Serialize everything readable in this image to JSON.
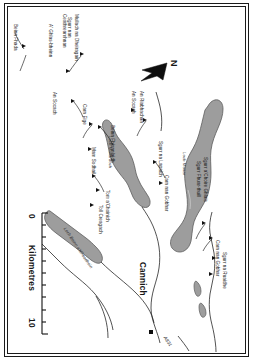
{
  "map": {
    "title": "Glen Affric and Cannich area relief map",
    "orientation_note": "map content rotated 90 degrees clockwise on page",
    "north_arrow": {
      "label": "N",
      "name": "north-arrow"
    },
    "scale": {
      "label": "Kilometres",
      "min": "0",
      "max": "10",
      "ticks": 10,
      "units": "km"
    },
    "town": {
      "name": "Cannich",
      "marker": "square"
    },
    "road": {
      "name": "A831"
    },
    "colors": {
      "water_fill": "#9a9a9a",
      "water_stroke": "#5b5b5b",
      "line": "#1a1a1a",
      "land": "#ffffff",
      "text": "#171717"
    },
    "lochs": [
      {
        "name": "Loch Monar"
      },
      {
        "name": "Loch Mullardoch"
      },
      {
        "name": "Loch Beinn a'Mheadhoin"
      }
    ],
    "peaks": [
      {
        "name": "Beinn Fhada"
      },
      {
        "name": "A' Ghlas-bheinn"
      },
      {
        "name": "Mullach na Dheiragain"
      },
      {
        "name": "Sgurr nan Ceathreamhnan"
      },
      {
        "name": "An Socach"
      },
      {
        "name": "Carn Eige"
      },
      {
        "name": "Mam Sodhail"
      },
      {
        "name": "Beinn Fhionnlaidh"
      },
      {
        "name": "Tom a'Choinich"
      },
      {
        "name": "Toll Creagach"
      },
      {
        "name": "An Riabhachan"
      },
      {
        "name": "An Socach"
      },
      {
        "name": "Sgurr na Lapaich"
      },
      {
        "name": "Carn nan Gobhar"
      },
      {
        "name": "Sgurr Fhuar-thuill"
      },
      {
        "name": "Sgurr a'Choire Ghlais"
      },
      {
        "name": "Carn nan Gobhar"
      },
      {
        "name": "Sgurr na Ruaidhe"
      }
    ]
  }
}
